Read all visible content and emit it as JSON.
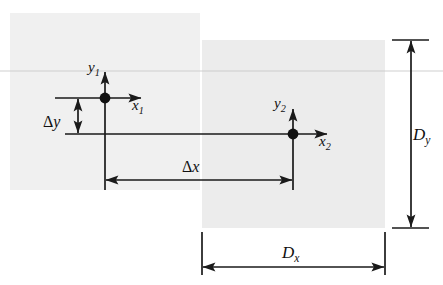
{
  "figure": {
    "background_color": "#ffffff",
    "ink_color": "#111111",
    "frame_fill_1": "#f0f0f0",
    "frame_fill_2": "#ececec",
    "scanline_color": "#c9c9c9"
  },
  "frames": [
    {
      "id": "image-frame-1",
      "label": "Image 1",
      "x": 10,
      "y": 13,
      "width": 190,
      "height": 177,
      "fill": "#f0f0f0"
    },
    {
      "id": "image-frame-2",
      "label": "Image 2",
      "x": 202,
      "y": 40,
      "width": 183,
      "height": 188,
      "fill": "#ececec"
    }
  ],
  "coordinate_systems": [
    {
      "id": "coordinate-system-1",
      "origin_x": 105,
      "origin_y": 98,
      "y_axis_label": "y",
      "y_axis_subscript": "1",
      "x_axis_label": "x",
      "x_axis_subscript": "1"
    },
    {
      "id": "coordinate-system-2",
      "origin_x": 293,
      "origin_y": 134,
      "y_axis_label": "y",
      "y_axis_subscript": "2",
      "x_axis_label": "x",
      "x_axis_subscript": "2"
    }
  ],
  "dimensions": [
    {
      "id": "delta-y",
      "symbol": "Δy",
      "orientation": "vertical",
      "from": 98,
      "to": 134,
      "axis_position": 78,
      "label_x": 58,
      "label_y": 122
    },
    {
      "id": "delta-x",
      "symbol": "Δx",
      "orientation": "horizontal",
      "from": 105,
      "to": 293,
      "axis_position": 180,
      "label_x": 199,
      "label_y": 170
    },
    {
      "id": "d-y",
      "symbol": "D",
      "subscript": "y",
      "orientation": "vertical",
      "from": 40,
      "to": 228,
      "axis_position": 411,
      "label_x": 424,
      "label_y": 139
    },
    {
      "id": "d-x",
      "symbol": "D",
      "subscript": "x",
      "orientation": "horizontal",
      "from": 202,
      "to": 385,
      "axis_position": 267,
      "label_x": 294,
      "label_y": 257
    }
  ],
  "connector_line": {
    "id": "horizontal-connector",
    "y": 134,
    "x_start": 65,
    "x_end": 296
  },
  "scanline": {
    "id": "faint-scanline",
    "y": 71,
    "x_start": 0,
    "x_end": 443
  },
  "labels": {
    "y1": "y",
    "y1_sub": "1",
    "x1": "x",
    "x1_sub": "1",
    "y2": "y",
    "y2_sub": "2",
    "x2": "x",
    "x2_sub": "2",
    "delta": "Δ",
    "delta_y_var": "y",
    "delta_x_var": "x",
    "D": "D",
    "D_sub_y": "y",
    "D_sub_x": "x"
  }
}
